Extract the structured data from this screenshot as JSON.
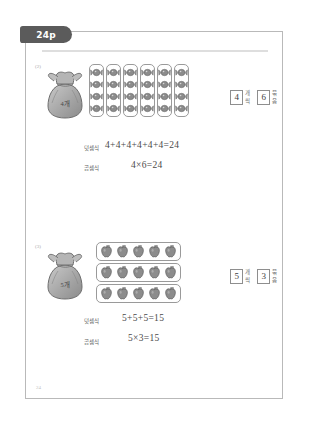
{
  "tab": {
    "label": "24p"
  },
  "footer": {
    "page_number": "24"
  },
  "problems": [
    {
      "number": "(2)",
      "bag_label": "4개",
      "group_size": 4,
      "group_count": 6,
      "answer": {
        "count_value": "4",
        "count_unit": "개씩",
        "group_value": "6",
        "group_unit": "묶음"
      },
      "addition": {
        "label": "덧셈식",
        "value": "4+4+4+4+4+4=24"
      },
      "multiplication": {
        "label": "곱셈식",
        "value": "4×6=24"
      },
      "item_icon": "candy-icon",
      "layout": "columns"
    },
    {
      "number": "(3)",
      "bag_label": "5개",
      "group_size": 5,
      "group_count": 3,
      "answer": {
        "count_value": "5",
        "count_unit": "개씩",
        "group_value": "3",
        "group_unit": "묶음"
      },
      "addition": {
        "label": "덧셈식",
        "value": "5+5+5=15"
      },
      "multiplication": {
        "label": "곱셈식",
        "value": "5×3=15"
      },
      "item_icon": "apple-icon",
      "layout": "rows"
    }
  ],
  "colors": {
    "tab_background": "#5b5b5b",
    "frame_border": "#b9b9b9",
    "rule": "#dedede",
    "item_fill": "#8c8c8c",
    "text": "#4a4a4a"
  }
}
